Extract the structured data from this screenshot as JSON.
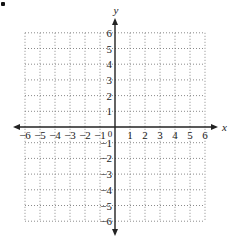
{
  "bullet": "•",
  "chart_data": {
    "type": "scatter",
    "title": "",
    "xlabel": "x",
    "ylabel": "y",
    "xlim": [
      -6,
      6
    ],
    "ylim": [
      -6,
      6
    ],
    "x_ticks": [
      -6,
      -5,
      -4,
      -3,
      -2,
      -1,
      0,
      1,
      2,
      3,
      4,
      5,
      6
    ],
    "y_ticks": [
      -6,
      -5,
      -4,
      -3,
      -2,
      -1,
      1,
      2,
      3,
      4,
      5,
      6
    ],
    "grid": true,
    "grid_style": "dotted",
    "origin_label": "0",
    "series": []
  },
  "colors": {
    "axis": "#222222",
    "grid": "#8a8a8a",
    "background": "#ffffff"
  }
}
